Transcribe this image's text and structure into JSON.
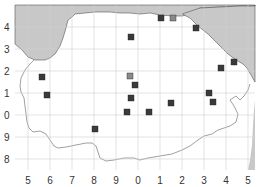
{
  "map": {
    "title": "",
    "colors": {
      "sea": "#c8c8c8",
      "land": "#ffffff",
      "grid": "#d0d0d0",
      "coast": "#555555",
      "marker_dark": "#3a3a3a",
      "marker_gray": "#8a8a8a"
    },
    "x_ticks": [
      {
        "label": "5",
        "x": 28
      },
      {
        "label": "6",
        "x": 50
      },
      {
        "label": "7",
        "x": 72
      },
      {
        "label": "8",
        "x": 94
      },
      {
        "label": "9",
        "x": 116
      },
      {
        "label": "0",
        "x": 138
      },
      {
        "label": "1",
        "x": 160
      },
      {
        "label": "2",
        "x": 182
      },
      {
        "label": "3",
        "x": 204
      },
      {
        "label": "4",
        "x": 226
      },
      {
        "label": "5",
        "x": 248
      }
    ],
    "y_ticks": [
      {
        "label": "4",
        "y": 27
      },
      {
        "label": "3",
        "y": 49
      },
      {
        "label": "2",
        "y": 71
      },
      {
        "label": "1",
        "y": 93
      },
      {
        "label": "0",
        "y": 115
      },
      {
        "label": "9",
        "y": 137
      },
      {
        "label": "8",
        "y": 159
      }
    ],
    "markers": [
      {
        "x": 42,
        "y": 77,
        "type": "dark"
      },
      {
        "x": 47,
        "y": 95,
        "type": "dark"
      },
      {
        "x": 131,
        "y": 37,
        "type": "dark"
      },
      {
        "x": 130,
        "y": 76,
        "type": "gray"
      },
      {
        "x": 135,
        "y": 85,
        "type": "dark"
      },
      {
        "x": 131,
        "y": 98,
        "type": "dark"
      },
      {
        "x": 127,
        "y": 112,
        "type": "dark"
      },
      {
        "x": 149,
        "y": 112,
        "type": "dark"
      },
      {
        "x": 171,
        "y": 103,
        "type": "dark"
      },
      {
        "x": 95,
        "y": 129,
        "type": "dark"
      },
      {
        "x": 161,
        "y": 18,
        "type": "dark"
      },
      {
        "x": 173,
        "y": 18,
        "type": "gray"
      },
      {
        "x": 196,
        "y": 28,
        "type": "dark"
      },
      {
        "x": 234,
        "y": 62,
        "type": "dark"
      },
      {
        "x": 221,
        "y": 68,
        "type": "dark"
      },
      {
        "x": 209,
        "y": 93,
        "type": "dark"
      },
      {
        "x": 213,
        "y": 102,
        "type": "dark"
      }
    ]
  }
}
